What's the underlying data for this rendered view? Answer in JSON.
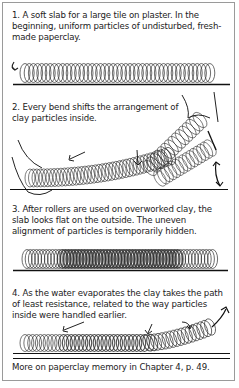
{
  "panels": [
    {
      "step": 1,
      "text": "1. A soft slab for a large tile on plaster. In the beginning, uniform particles of undisturbed, fresh-made paperclay.",
      "illustration": "uniform-particle-coil"
    },
    {
      "step": 2,
      "text": "2. Every bend shifts the arrangement of clay particles inside.",
      "illustration": "bent-slab-with-hands-and-arrows"
    },
    {
      "step": 3,
      "text": "3. After rollers are used on overworked clay, the slab looks flat on the outside. The uneven alignment of particles is temporarily hidden.",
      "illustration": "compressed-particle-coil"
    },
    {
      "step": 4,
      "text": "4. As the water evaporates the clay takes the path of least resistance, related to the way particles inside were handled earlier.",
      "illustration": "warping-slab-with-arrows"
    }
  ],
  "footer": "More on paperclay memory in Chapter 4, p. 49.",
  "colors": {
    "ink": "#222222",
    "frame": "#9a9a9a",
    "background": "#ffffff"
  }
}
